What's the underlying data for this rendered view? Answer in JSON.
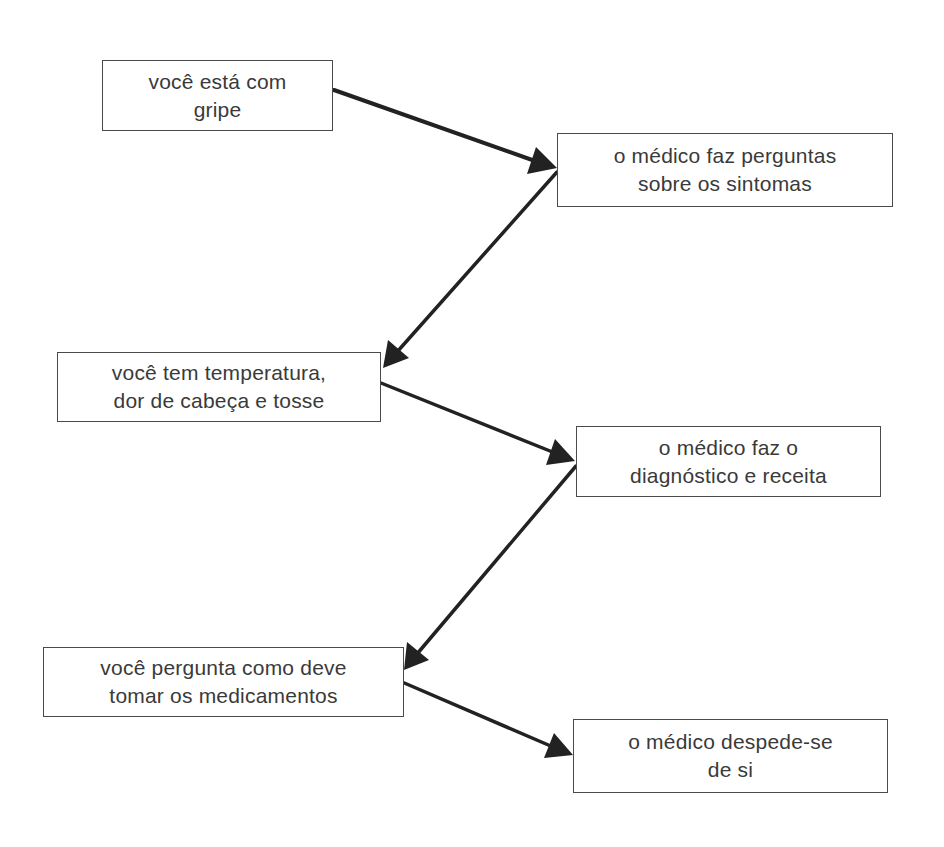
{
  "diagram": {
    "type": "flowchart",
    "nodes": [
      {
        "id": "n1",
        "line1": "você está com",
        "line2": "gripe"
      },
      {
        "id": "n2",
        "line1": "o médico faz perguntas",
        "line2": "sobre os sintomas"
      },
      {
        "id": "n3",
        "line1": "você tem temperatura,",
        "line2": "dor de cabeça e tosse"
      },
      {
        "id": "n4",
        "line1": "o médico faz o",
        "line2": "diagnóstico e receita"
      },
      {
        "id": "n5",
        "line1": "você pergunta como deve",
        "line2": "tomar os medicamentos"
      },
      {
        "id": "n6",
        "line1": "o médico despede-se",
        "line2": "de si"
      }
    ],
    "edges": [
      {
        "from": "n1",
        "to": "n2"
      },
      {
        "from": "n2",
        "to": "n3"
      },
      {
        "from": "n3",
        "to": "n4"
      },
      {
        "from": "n4",
        "to": "n5"
      },
      {
        "from": "n5",
        "to": "n6"
      }
    ],
    "colors": {
      "border": "#4a4a4a",
      "text": "#3a3a3a",
      "arrow": "#222222",
      "background": "#ffffff"
    }
  }
}
